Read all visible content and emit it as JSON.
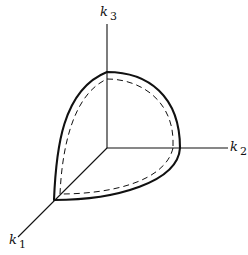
{
  "diagram": {
    "axes": [
      {
        "id": "k1",
        "letter": "k",
        "subscript": "1",
        "direction": "out-of-page (down-left)"
      },
      {
        "id": "k2",
        "letter": "k",
        "subscript": "2",
        "direction": "right"
      },
      {
        "id": "k3",
        "letter": "k",
        "subscript": "3",
        "direction": "up"
      }
    ],
    "curves": [
      {
        "id": "outer-surface",
        "style": "solid",
        "weight": "thick"
      },
      {
        "id": "inner-surface",
        "style": "dashed",
        "weight": "thin"
      }
    ],
    "colors": {
      "line": "#111111",
      "background": "#ffffff"
    }
  }
}
